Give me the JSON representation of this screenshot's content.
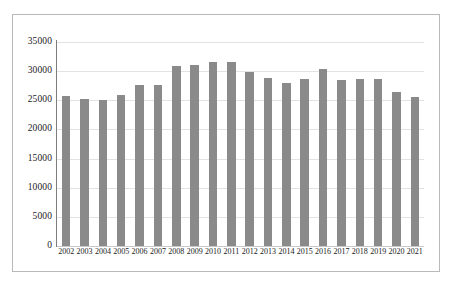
{
  "chart_data": {
    "type": "bar",
    "title": "",
    "subtitle": "",
    "xlabel": "",
    "ylabel": "",
    "categories": [
      "2002",
      "2003",
      "2004",
      "2005",
      "2006",
      "2007",
      "2008",
      "2009",
      "2010",
      "2011",
      "2012",
      "2013",
      "2014",
      "2015",
      "2016",
      "2017",
      "2018",
      "2019",
      "2020",
      "2021"
    ],
    "values": [
      25700,
      25300,
      25100,
      25900,
      27700,
      27700,
      30900,
      31100,
      31600,
      31500,
      29800,
      28900,
      28000,
      28600,
      30300,
      28500,
      28600,
      28700,
      26400,
      25500
    ],
    "series": [
      {
        "name": "value",
        "values": [
          25700,
          25300,
          25100,
          25900,
          27700,
          27700,
          30900,
          31100,
          31600,
          31500,
          29800,
          28900,
          28000,
          28600,
          30300,
          28500,
          28600,
          28700,
          26400,
          25500
        ]
      }
    ],
    "ylim": [
      0,
      35000
    ],
    "yticks": [
      0,
      5000,
      10000,
      15000,
      20000,
      25000,
      30000,
      35000
    ],
    "ytick_labels": [
      "0",
      "5000",
      "10000",
      "15000",
      "20000",
      "25000",
      "30000",
      "35000"
    ],
    "grid": true,
    "grid_axis": "y",
    "legend": false,
    "legend_position": "none",
    "bar_color": "#8a8a8a",
    "gridline_color": "#e3e3e3",
    "axis_color": "#7d7d7d",
    "frame_color": "#b9b9b9",
    "background_color": "#ffffff"
  }
}
